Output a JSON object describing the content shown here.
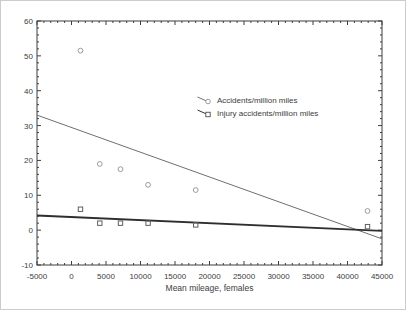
{
  "window": {
    "width": 406,
    "height": 310,
    "background": "#ffffff",
    "border_color": "#cccccc"
  },
  "chart_data": {
    "type": "scatter",
    "title": "",
    "xlabel": "Mean mileage, females",
    "ylabel": "",
    "xlim": [
      -5000,
      45000
    ],
    "ylim": [
      -10,
      60
    ],
    "x_major_ticks": [
      -5000,
      0,
      5000,
      10000,
      15000,
      20000,
      25000,
      30000,
      35000,
      40000,
      45000
    ],
    "x_tick_labels": [
      "-5000",
      "0",
      "5000",
      "10000",
      "15000",
      "20000",
      "25000",
      "30000",
      "35000",
      "40000",
      "45000"
    ],
    "x_minor_step": 1000,
    "y_major_ticks": [
      -10,
      0,
      10,
      20,
      30,
      40,
      50,
      60
    ],
    "y_tick_labels": [
      "-10",
      "0",
      "10",
      "20",
      "30",
      "40",
      "50",
      "60"
    ],
    "y_minor_step": 2,
    "grid": false,
    "frame_color": "#3d3d3d",
    "tick_label_color": "#3d3d3d",
    "legend_position": "inside-center-right",
    "x": [
      1300,
      4100,
      7100,
      11100,
      18000,
      42900
    ],
    "series": [
      {
        "name": "Accidents/million miles",
        "marker": "circle",
        "marker_color": "#9b9b9b",
        "values": [
          51.5,
          19,
          17.5,
          13,
          11.5,
          5.5
        ],
        "trend_line": {
          "from": [
            -5000,
            33
          ],
          "to": [
            45000,
            -2.5
          ],
          "color": "#6f6f6f",
          "width": 1
        }
      },
      {
        "name": "Injury accidents/million miles",
        "marker": "square",
        "marker_color": "#5f5f5f",
        "values": [
          6,
          2,
          2,
          2,
          1.5,
          1
        ],
        "trend_line": {
          "from": [
            -5000,
            4.2
          ],
          "to": [
            45000,
            -0.2
          ],
          "color": "#2e2e2e",
          "width": 1.8
        }
      }
    ]
  }
}
